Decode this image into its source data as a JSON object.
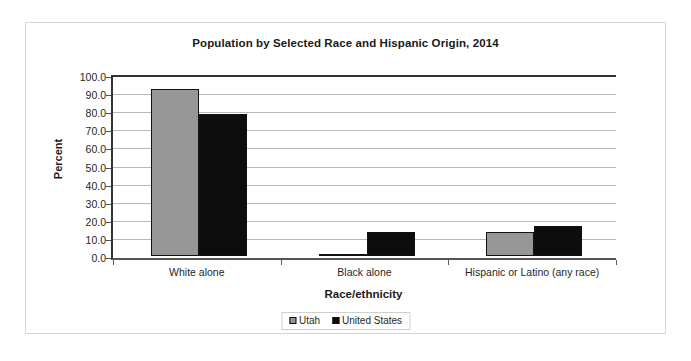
{
  "chart_data": {
    "type": "bar",
    "title": "Population by Selected Race and Hispanic Origin, 2014",
    "xlabel": "Race/ethnicity",
    "ylabel": "Percent",
    "ylim": [
      0,
      100
    ],
    "ytick_step": 10,
    "ytick_labels": [
      "100.0",
      "90.0",
      "80.0",
      "70.0",
      "60.0",
      "50.0",
      "40.0",
      "30.0",
      "20.0",
      "10.0",
      "0.0"
    ],
    "ytick_values": [
      100,
      90,
      80,
      70,
      60,
      50,
      40,
      30,
      20,
      10,
      0
    ],
    "grid": "horizontal",
    "legend_position": "bottom",
    "categories": [
      "White alone",
      "Black alone",
      "Hispanic or Latino (any race)"
    ],
    "series": [
      {
        "name": "Utah",
        "color": "#969696",
        "values": [
          92.5,
          1.3,
          13.3
        ]
      },
      {
        "name": "United States",
        "color": "#0d0d0d",
        "values": [
          78.5,
          13.2,
          16.5
        ]
      }
    ]
  },
  "legend": {
    "items": [
      {
        "label": "Utah",
        "swatch": "utah"
      },
      {
        "label": "United States",
        "swatch": "us"
      }
    ]
  },
  "colors": {
    "utah": "#969696",
    "united_states": "#0d0d0d",
    "gridline": "#b9b9b9",
    "axis": "#333333",
    "frame": "#d6d6d6"
  }
}
